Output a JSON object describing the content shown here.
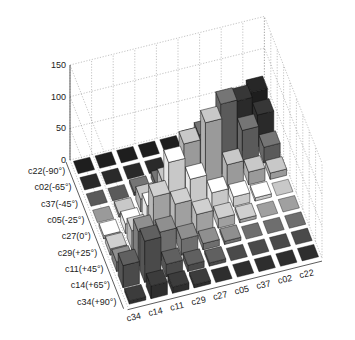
{
  "chart_data": {
    "type": "bar3d",
    "title": "",
    "zlabel": "",
    "zlim": [
      0,
      150
    ],
    "z_ticks": [
      "0",
      "50",
      "100",
      "150"
    ],
    "z_tick_values": [
      0,
      50,
      100,
      150
    ],
    "row_labels": [
      "c22(-90°)",
      "c02(-65°)",
      "c37(-45°)",
      "c05(-25°)",
      "c27(0°)",
      "c29(+25°)",
      "c11(+45°)",
      "c14(+65°)",
      "c34(+90°)"
    ],
    "col_labels": [
      "c34",
      "c14",
      "c11",
      "c29",
      "c27",
      "c05",
      "c37",
      "c02",
      "c22"
    ],
    "row_colors": [
      "#1e1e1e",
      "#2a2a2a",
      "#5a5a5a",
      "#9a9a9a",
      "#c8c8c8",
      "#a0a0a0",
      "#6e6e6e",
      "#4a4a4a",
      "#2e2e2e"
    ],
    "values": [
      [
        0,
        0,
        0,
        0,
        0,
        5,
        15,
        30,
        60
      ],
      [
        0,
        0,
        0,
        0,
        5,
        20,
        40,
        80,
        50
      ],
      [
        0,
        0,
        5,
        10,
        30,
        70,
        110,
        60,
        25
      ],
      [
        0,
        5,
        20,
        40,
        90,
        115,
        40,
        20,
        10
      ],
      [
        5,
        15,
        35,
        95,
        60,
        30,
        15,
        5,
        0
      ],
      [
        10,
        30,
        75,
        55,
        30,
        15,
        5,
        0,
        0
      ],
      [
        15,
        55,
        45,
        25,
        10,
        5,
        0,
        0,
        0
      ],
      [
        35,
        65,
        20,
        10,
        5,
        0,
        0,
        0,
        0
      ],
      [
        5,
        20,
        10,
        5,
        0,
        0,
        0,
        0,
        0
      ]
    ],
    "grid": true,
    "legend": null
  }
}
